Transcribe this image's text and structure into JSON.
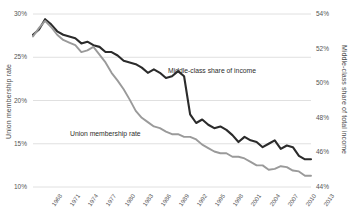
{
  "axes": {
    "left_title": "Union membership rate",
    "right_title": "Middle-class share of total income",
    "left_ticks": [
      "30%",
      "25%",
      "20%",
      "15%",
      "10%"
    ],
    "left_tick_values": [
      30,
      25,
      20,
      15,
      10
    ],
    "right_ticks": [
      "54%",
      "52%",
      "50%",
      "48%",
      "46%",
      "44%"
    ],
    "right_tick_values": [
      54,
      52,
      50,
      48,
      46,
      44
    ],
    "x_ticks": [
      "1968",
      "1971",
      "1974",
      "1977",
      "1980",
      "1983",
      "1986",
      "1989",
      "1992",
      "1995",
      "1998",
      "2001",
      "2004",
      "2007",
      "2010",
      "2013"
    ]
  },
  "annotations": {
    "middle_class": "Middle-class share of income",
    "union": "Union membership rate"
  },
  "colors": {
    "middle_class_line": "#2b2b2b",
    "union_line": "#9a9a9a",
    "gridline": "#d8d8d8",
    "text": "#4a4a4a",
    "background": "#ffffff"
  },
  "chart_data": {
    "type": "line",
    "title": "",
    "subtitle": "",
    "xlabel": "",
    "ylabel": "Union membership rate",
    "y2label": "Middle-class share of total income",
    "grid": true,
    "legend": "none",
    "annotated_series_labels": true,
    "ylim": [
      10,
      30
    ],
    "y2lim": [
      44,
      54
    ],
    "xlim": [
      1967,
      2013
    ],
    "x": [
      1967,
      1968,
      1969,
      1970,
      1971,
      1972,
      1973,
      1974,
      1975,
      1976,
      1977,
      1978,
      1979,
      1980,
      1981,
      1982,
      1983,
      1984,
      1985,
      1986,
      1987,
      1988,
      1989,
      1990,
      1991,
      1992,
      1993,
      1994,
      1995,
      1996,
      1997,
      1998,
      1999,
      2000,
      2001,
      2002,
      2003,
      2004,
      2005,
      2006,
      2007,
      2008,
      2009,
      2010,
      2011,
      2012,
      2013
    ],
    "series": [
      {
        "name": "Middle-class share of income",
        "axis": "right",
        "color": "#2b2b2b",
        "unit": "%",
        "values": [
          52.8,
          53.1,
          53.7,
          53.4,
          53.0,
          52.8,
          52.7,
          52.6,
          52.3,
          52.4,
          52.2,
          52.1,
          51.8,
          51.8,
          51.6,
          51.3,
          51.2,
          51.1,
          50.9,
          50.6,
          50.8,
          50.6,
          50.3,
          50.4,
          50.7,
          50.4,
          48.2,
          47.7,
          47.9,
          47.6,
          47.4,
          47.5,
          47.3,
          47.0,
          46.6,
          46.9,
          46.7,
          46.6,
          46.3,
          46.5,
          46.7,
          46.2,
          46.4,
          46.3,
          45.8,
          45.6,
          45.6
        ]
      },
      {
        "name": "Union membership rate",
        "axis": "left",
        "color": "#9a9a9a",
        "unit": "%",
        "values": [
          27.4,
          28.4,
          29.2,
          28.5,
          27.6,
          27.0,
          26.7,
          26.4,
          25.6,
          25.8,
          26.2,
          25.3,
          24.4,
          23.2,
          22.3,
          21.3,
          20.1,
          18.8,
          18.0,
          17.5,
          17.0,
          16.8,
          16.4,
          16.1,
          16.1,
          15.8,
          15.8,
          15.5,
          14.9,
          14.5,
          14.1,
          13.9,
          13.9,
          13.5,
          13.5,
          13.3,
          12.9,
          12.5,
          12.5,
          12.0,
          12.1,
          12.4,
          12.3,
          11.9,
          11.8,
          11.3,
          11.3
        ]
      }
    ]
  }
}
